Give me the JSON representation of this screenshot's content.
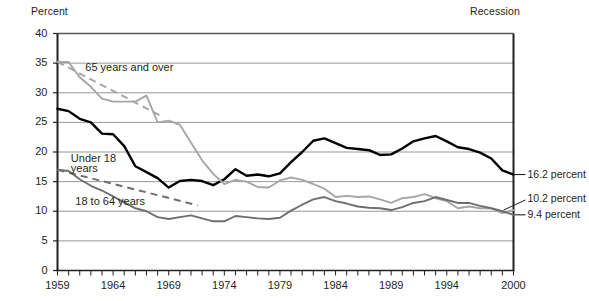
{
  "header": {
    "y_axis_title": "Percent",
    "recession_note": "Recession"
  },
  "chart_data": {
    "type": "line",
    "title": "",
    "subtitle": "",
    "xlabel": "",
    "ylabel": "Percent",
    "xlim": [
      1959,
      2000
    ],
    "ylim": [
      0,
      40
    ],
    "grid": true,
    "legend_position": "inline-annotations",
    "yticks": [
      0,
      5,
      10,
      15,
      20,
      25,
      30,
      35,
      40
    ],
    "xticks_labeled": [
      1959,
      1964,
      1969,
      1974,
      1979,
      1984,
      1989,
      1994,
      2000
    ],
    "x": [
      1959,
      1960,
      1961,
      1962,
      1963,
      1964,
      1965,
      1966,
      1967,
      1968,
      1969,
      1970,
      1971,
      1972,
      1973,
      1974,
      1975,
      1976,
      1977,
      1978,
      1979,
      1980,
      1981,
      1982,
      1983,
      1984,
      1985,
      1986,
      1987,
      1988,
      1989,
      1990,
      1991,
      1992,
      1993,
      1994,
      1995,
      1996,
      1997,
      1998,
      1999,
      2000
    ],
    "series": [
      {
        "name": "Under 18 years",
        "color": "#000000",
        "end_value": 16.2,
        "end_label": "16.2 percent",
        "values": [
          27.3,
          26.9,
          25.6,
          25.0,
          23.1,
          23.0,
          21.0,
          17.6,
          16.6,
          15.6,
          14.0,
          15.1,
          15.3,
          15.1,
          14.4,
          15.4,
          17.1,
          16.0,
          16.2,
          15.9,
          16.4,
          18.3,
          20.0,
          21.9,
          22.3,
          21.5,
          20.7,
          20.5,
          20.3,
          19.5,
          19.6,
          20.6,
          21.8,
          22.3,
          22.7,
          21.8,
          20.8,
          20.5,
          19.9,
          18.9,
          16.9,
          16.2
        ]
      },
      {
        "name": "65 years and over",
        "color": "#a6a6a6",
        "end_value": 10.2,
        "end_label": "10.2 percent",
        "values": [
          35.2,
          35.2,
          32.6,
          31.0,
          29.0,
          28.5,
          28.5,
          28.5,
          29.5,
          25.0,
          25.3,
          24.6,
          21.6,
          18.6,
          16.3,
          14.6,
          15.3,
          15.0,
          14.1,
          14.0,
          15.2,
          15.7,
          15.3,
          14.6,
          13.8,
          12.4,
          12.6,
          12.4,
          12.5,
          12.0,
          11.4,
          12.2,
          12.4,
          12.9,
          12.2,
          11.7,
          10.5,
          10.8,
          10.5,
          10.5,
          9.7,
          10.2
        ]
      },
      {
        "name": "18 to 64 years",
        "color": "#6d6e70",
        "end_value": 9.4,
        "end_label": "9.4 percent",
        "values": [
          17.0,
          16.8,
          15.4,
          14.3,
          13.5,
          12.5,
          11.5,
          10.5,
          10.0,
          9.0,
          8.7,
          9.0,
          9.3,
          8.8,
          8.3,
          8.3,
          9.2,
          9.0,
          8.8,
          8.7,
          8.9,
          10.1,
          11.1,
          12.0,
          12.4,
          11.7,
          11.3,
          10.8,
          10.6,
          10.5,
          10.2,
          10.7,
          11.4,
          11.7,
          12.4,
          11.9,
          11.4,
          11.4,
          10.9,
          10.5,
          10.0,
          9.4
        ]
      }
    ],
    "annotations": [
      {
        "text": "65 years and over",
        "x": 1961.5,
        "y": 34.2
      },
      {
        "text": "Under 18",
        "x": 1960.2,
        "y": 18.8
      },
      {
        "text": "years",
        "x": 1960.2,
        "y": 17.2
      },
      {
        "text": "18 to 64 years",
        "x": 1960.6,
        "y": 11.5
      }
    ]
  }
}
